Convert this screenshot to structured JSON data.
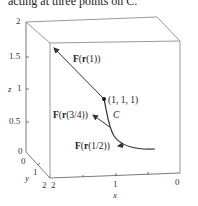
{
  "caption": "acting at three points on C.",
  "figure": {
    "axes": {
      "z_label": "z",
      "y_label": "y",
      "x_label": "x",
      "z_ticks": [
        "2",
        "1.5",
        "1",
        "0.5",
        "0"
      ],
      "y_ticks": [
        "0",
        "1",
        "2"
      ],
      "x_ticks": [
        "2",
        "1",
        "0"
      ]
    },
    "curve_label": "C",
    "point_label": "(1, 1, 1)",
    "vectors": [
      {
        "F": "F",
        "r": "r",
        "arg": "(1)"
      },
      {
        "F": "F",
        "r": "r",
        "arg": "(3/4)"
      },
      {
        "F": "F",
        "r": "r",
        "arg": "(1/2)"
      }
    ]
  }
}
